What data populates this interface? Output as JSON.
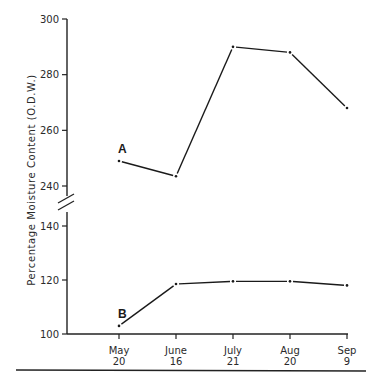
{
  "chart_data": {
    "type": "line",
    "title": "",
    "xlabel": "",
    "ylabel": "Percentage Moisture Content (O.D.W.)",
    "categories": [
      "May 20",
      "June 16",
      "July 21",
      "Aug 20",
      "Sep 9"
    ],
    "category_lines": [
      [
        "May",
        "20"
      ],
      [
        "June",
        "16"
      ],
      [
        "July",
        "21"
      ],
      [
        "Aug",
        "20"
      ],
      [
        "Sep",
        "9"
      ]
    ],
    "axis_break": true,
    "ylim_upper": [
      240,
      300
    ],
    "ylim_lower": [
      100,
      140
    ],
    "yticks_upper": [
      "240",
      "260",
      "280",
      "300"
    ],
    "yticks_lower": [
      "100",
      "120",
      "140"
    ],
    "grid": false,
    "legend": "none",
    "series": [
      {
        "name": "A",
        "values": [
          249,
          243.5,
          290,
          288,
          268
        ]
      },
      {
        "name": "B",
        "values": [
          103,
          118.5,
          119.5,
          119.5,
          118
        ]
      }
    ],
    "caption": "Figure"
  }
}
